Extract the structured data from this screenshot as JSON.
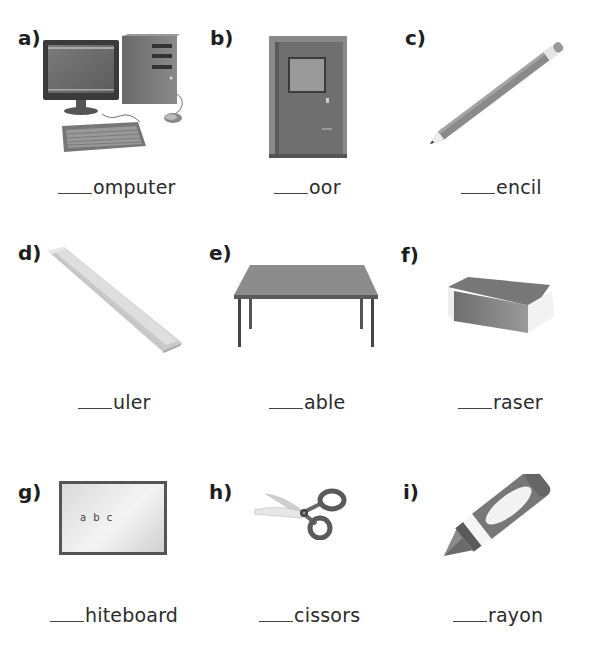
{
  "worksheet": {
    "items": [
      {
        "letter": "a)",
        "word_suffix": "omputer",
        "image": "computer-icon"
      },
      {
        "letter": "b)",
        "word_suffix": "oor",
        "image": "door-icon"
      },
      {
        "letter": "c)",
        "word_suffix": "encil",
        "image": "pencil-icon"
      },
      {
        "letter": "d)",
        "word_suffix": "uler",
        "image": "ruler-icon"
      },
      {
        "letter": "e)",
        "word_suffix": "able",
        "image": "table-icon"
      },
      {
        "letter": "f)",
        "word_suffix": "raser",
        "image": "eraser-icon"
      },
      {
        "letter": "g)",
        "word_suffix": "hiteboard",
        "image": "whiteboard-icon",
        "board_text": "a b c"
      },
      {
        "letter": "h)",
        "word_suffix": "cissors",
        "image": "scissors-icon"
      },
      {
        "letter": "i)",
        "word_suffix": "rayon",
        "image": "crayon-icon"
      }
    ]
  }
}
